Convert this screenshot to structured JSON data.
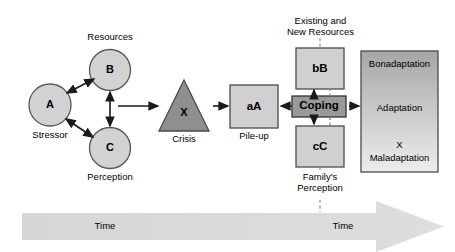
{
  "diagram": {
    "colors": {
      "circle_fill": "#d2d2d2",
      "circle_stroke": "#555555",
      "triangle_fill": "#8f8f8f",
      "triangle_stroke": "#4a4a4a",
      "box_fill": "#d0d0d0",
      "box_stroke": "#4a4a4a",
      "coping_fill": "#9a9a9a",
      "coping_stroke": "#333333",
      "adaptation_top": "#a8a8a8",
      "adaptation_bottom": "#e8e8e8",
      "arrow_color": "#1a1a1a",
      "timeline_fill": "#d9d9d9",
      "background": "#ffffff"
    },
    "nodes": {
      "a": {
        "symbol": "A",
        "caption": "Stressor"
      },
      "b": {
        "symbol": "B",
        "caption": "Resources"
      },
      "c": {
        "symbol": "C",
        "caption": "Perception"
      },
      "crisis": {
        "symbol": "X",
        "caption": "Crisis"
      },
      "pileup": {
        "symbol": "aA",
        "caption": "Pile-up"
      },
      "bb": {
        "symbol": "bB",
        "caption_line1": "Existing and",
        "caption_line2": "New Resources"
      },
      "coping": {
        "symbol": "Coping"
      },
      "cc": {
        "symbol": "cC",
        "caption_line1": "Family's",
        "caption_line2": "Perception"
      },
      "adaptation": {
        "top_label": "Bonadaptation",
        "middle_label": "Adaptation",
        "bottom_marker": "X",
        "bottom_label": "Maladaptation"
      }
    },
    "timeline": {
      "left_label": "Time",
      "right_label": "Time"
    }
  }
}
